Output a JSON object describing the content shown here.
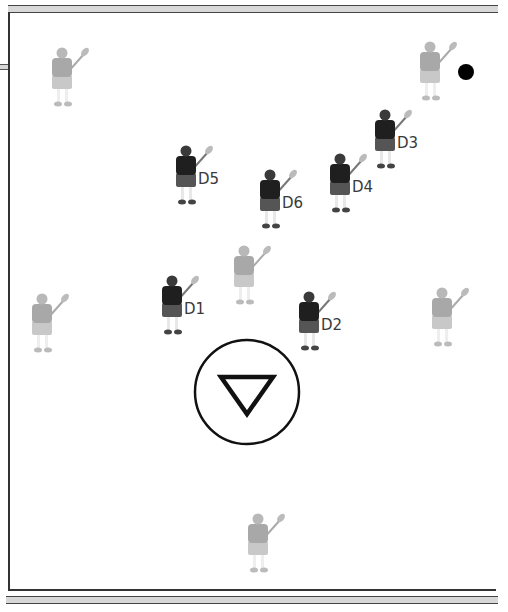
{
  "diagram": {
    "type": "lacrosse-defensive-formation",
    "colors": {
      "defense": "#1f1f1f",
      "defense_shorts": "#555555",
      "offense": "#a8a8a8",
      "offense_light": "#c8c8c8",
      "ball": "#000000",
      "lines": "#333333",
      "line_fill": "#d8d8d8"
    },
    "defenders": [
      {
        "id": "D1",
        "label": "D1",
        "x": 172,
        "y": 302
      },
      {
        "id": "D2",
        "label": "D2",
        "x": 309,
        "y": 318
      },
      {
        "id": "D3",
        "label": "D3",
        "x": 385,
        "y": 136
      },
      {
        "id": "D4",
        "label": "D4",
        "x": 340,
        "y": 180
      },
      {
        "id": "D5",
        "label": "D5",
        "x": 186,
        "y": 172
      },
      {
        "id": "D6",
        "label": "D6",
        "x": 270,
        "y": 196
      }
    ],
    "attackers": [
      {
        "id": "A-top-left",
        "x": 62,
        "y": 74
      },
      {
        "id": "A-top-right",
        "x": 430,
        "y": 68
      },
      {
        "id": "A-center",
        "x": 244,
        "y": 272
      },
      {
        "id": "A-left",
        "x": 42,
        "y": 320
      },
      {
        "id": "A-right",
        "x": 442,
        "y": 314
      },
      {
        "id": "A-bottom",
        "x": 258,
        "y": 540
      }
    ],
    "ball": {
      "x": 466,
      "y": 72
    },
    "goal": {
      "cx": 247,
      "cy": 392,
      "r": 52,
      "symbol": "triangle-down"
    }
  }
}
